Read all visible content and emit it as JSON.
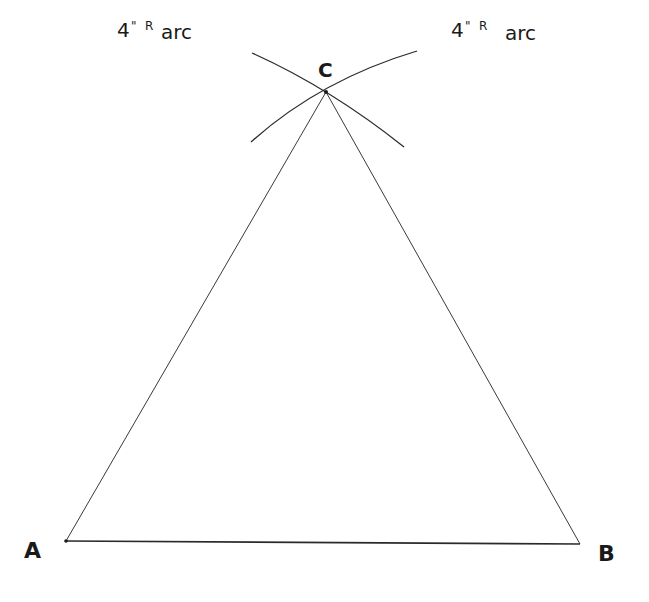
{
  "diagram": {
    "type": "geometric-construction",
    "vertices": {
      "A": {
        "label": "A",
        "x": 66,
        "y": 541
      },
      "B": {
        "label": "B",
        "x": 580,
        "y": 544
      },
      "C": {
        "label": "C",
        "x": 326,
        "y": 92
      }
    },
    "edges": [
      {
        "from": "A",
        "to": "B"
      },
      {
        "from": "A",
        "to": "C"
      },
      {
        "from": "B",
        "to": "C"
      }
    ],
    "arcs": [
      {
        "label_main": "4",
        "label_mark": "\"",
        "label_sup": "R",
        "label_word": "arc",
        "center": "A",
        "position": "left"
      },
      {
        "label_main": "4",
        "label_mark": "\"",
        "label_sup": "R",
        "label_word": "arc",
        "center": "B",
        "position": "right"
      }
    ],
    "colors": {
      "stroke": "#2a2a2a",
      "text": "#1a1a1a",
      "background": "#ffffff"
    }
  }
}
